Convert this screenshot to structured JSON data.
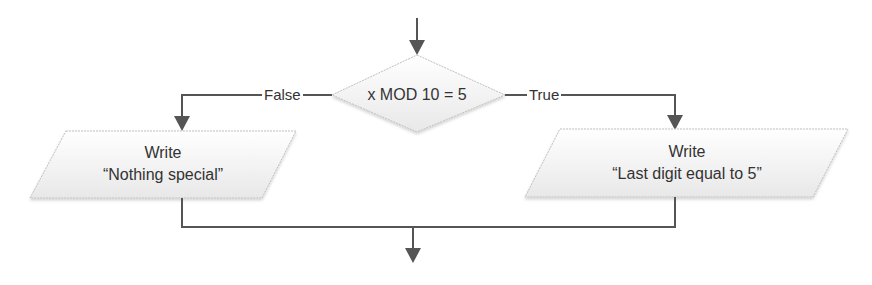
{
  "diagram": {
    "type": "flowchart",
    "decision": {
      "label": "x MOD 10 = 5"
    },
    "branches": {
      "false": {
        "label": "False",
        "action_title": "Write",
        "action_text": "“Nothing special”"
      },
      "true": {
        "label": "True",
        "action_title": "Write",
        "action_text": "“Last digit equal to 5”"
      }
    },
    "colors": {
      "line": "#555555",
      "shape_fill": "#f2f2f2",
      "shape_border": "#bfbfbf",
      "text": "#333333"
    }
  }
}
